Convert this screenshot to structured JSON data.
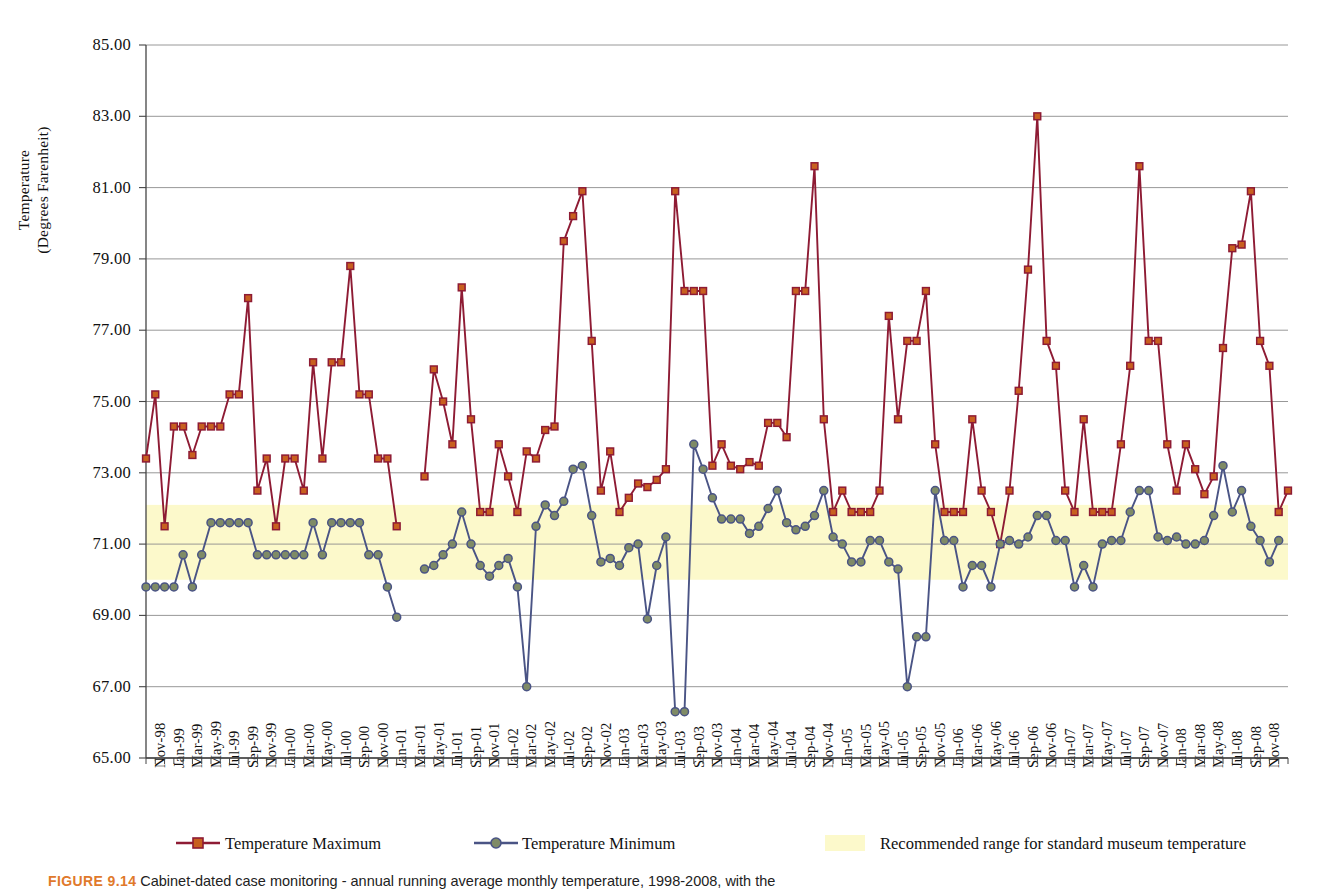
{
  "chart_data": {
    "type": "line",
    "title": "",
    "xlabel": "",
    "ylabel": "Temperature\n(Degrees Farenheit)",
    "ylim": [
      65.0,
      85.0
    ],
    "ytick_values": [
      65.0,
      67.0,
      69.0,
      71.0,
      73.0,
      75.0,
      77.0,
      79.0,
      81.0,
      83.0,
      85.0
    ],
    "ytick_labels": [
      "65.00",
      "67.00",
      "69.00",
      "71.00",
      "73.00",
      "75.00",
      "77.00",
      "79.00",
      "81.00",
      "83.00",
      "85.00"
    ],
    "grid": true,
    "legend_position": "bottom",
    "x_start": "Nov-98",
    "x_end": "Nov-08",
    "xtick_labels": [
      "Nov-98",
      "Jan-99",
      "Mar-99",
      "May-99",
      "Jul-99",
      "Sep-99",
      "Nov-99",
      "Jan-00",
      "Mar-00",
      "May-00",
      "Jul-00",
      "Sep-00",
      "Nov-00",
      "Jan-01",
      "Mar-01",
      "May-01",
      "Jul-01",
      "Sep-01",
      "Nov-01",
      "Jan-02",
      "Mar-02",
      "May-02",
      "Jul-02",
      "Sep-02",
      "Nov-02",
      "Jan-03",
      "Mar-03",
      "May-03",
      "Jul-03",
      "Sep-03",
      "Nov-03",
      "Jan-04",
      "Mar-04",
      "May-04",
      "Jul-04",
      "Sep-04",
      "Nov-04",
      "Jan-05",
      "Mar-05",
      "May-05",
      "Jul-05",
      "Sep-05",
      "Nov-05",
      "Jan-06",
      "Mar-06",
      "May-06",
      "Jul-06",
      "Sep-06",
      "Nov-06",
      "Jan-07",
      "Mar-07",
      "May-07",
      "Jul-07",
      "Sep-07",
      "Nov-07",
      "Jan-08",
      "Mar-08",
      "May-08",
      "Jul-08",
      "Sep-08",
      "Nov-08"
    ],
    "series": [
      {
        "name": "Temperature Maximum",
        "color": "#8E1B34",
        "marker": "square",
        "marker_fill": "#C8601F",
        "values": [
          73.4,
          75.2,
          71.5,
          74.3,
          74.3,
          73.5,
          74.3,
          74.3,
          74.3,
          75.2,
          75.2,
          77.9,
          72.5,
          73.4,
          71.5,
          73.4,
          73.4,
          72.5,
          76.1,
          73.4,
          76.1,
          76.1,
          78.8,
          75.2,
          75.2,
          73.4,
          73.4,
          71.5,
          null,
          null,
          72.9,
          75.9,
          75.0,
          73.8,
          78.2,
          74.5,
          71.9,
          71.9,
          73.8,
          72.9,
          71.9,
          73.6,
          73.4,
          74.2,
          74.3,
          79.5,
          80.2,
          80.9,
          76.7,
          72.5,
          73.6,
          71.9,
          72.3,
          72.7,
          72.6,
          72.8,
          73.1,
          80.9,
          78.1,
          78.1,
          78.1,
          73.2,
          73.8,
          73.2,
          73.1,
          73.3,
          73.2,
          74.4,
          74.4,
          74.0,
          78.1,
          78.1,
          81.6,
          74.5,
          71.9,
          72.5,
          71.9,
          71.9,
          71.9,
          72.5,
          77.4,
          74.5,
          76.7,
          76.7,
          78.1,
          73.8,
          71.9,
          71.9,
          71.9,
          74.5,
          72.5,
          71.9,
          71.0,
          72.5,
          75.3,
          78.7,
          83.0,
          76.7,
          76.0,
          72.5,
          71.9,
          74.5,
          71.9,
          71.9,
          71.9,
          73.8,
          76.0,
          81.6,
          76.7,
          76.7,
          73.8,
          72.5,
          73.8,
          73.1,
          72.4,
          72.9,
          76.5,
          79.3,
          79.4,
          80.9,
          76.7,
          76.0,
          71.9,
          72.5
        ]
      },
      {
        "name": "Temperature Minimum",
        "color": "#4A5485",
        "marker": "circle",
        "marker_fill": "#7F8B66",
        "values": [
          69.8,
          69.8,
          69.8,
          69.8,
          70.7,
          69.8,
          70.7,
          71.6,
          71.6,
          71.6,
          71.6,
          71.6,
          70.7,
          70.7,
          70.7,
          70.7,
          70.7,
          70.7,
          71.6,
          70.7,
          71.6,
          71.6,
          71.6,
          71.6,
          70.7,
          70.7,
          69.8,
          68.95,
          null,
          null,
          70.3,
          70.4,
          70.7,
          71.0,
          71.9,
          71.0,
          70.4,
          70.1,
          70.4,
          70.6,
          69.8,
          67.0,
          71.5,
          72.1,
          71.8,
          72.2,
          73.1,
          73.2,
          71.8,
          70.5,
          70.6,
          70.4,
          70.9,
          71.0,
          68.9,
          70.4,
          71.2,
          66.3,
          66.3,
          73.8,
          73.1,
          72.3,
          71.7,
          71.7,
          71.7,
          71.3,
          71.5,
          72.0,
          72.5,
          71.6,
          71.4,
          71.5,
          71.8,
          72.5,
          71.2,
          71.0,
          70.5,
          70.5,
          71.1,
          71.1,
          70.5,
          70.3,
          67.0,
          68.4,
          68.4,
          72.5,
          71.1,
          71.1,
          69.8,
          70.4,
          70.4,
          69.8,
          71.0,
          71.1,
          71.0,
          71.2,
          71.8,
          71.8,
          71.1,
          71.1,
          69.8,
          70.4,
          69.8,
          71.0,
          71.1,
          71.1,
          71.9,
          72.5,
          72.5,
          71.2,
          71.1,
          71.2,
          71.0,
          71.0,
          71.1,
          71.8,
          73.2,
          71.9,
          72.5,
          71.5,
          71.1,
          70.5,
          71.1
        ]
      }
    ],
    "bands": [
      {
        "name": "Recommended range for standard museum temperature",
        "color": "#FCF9CB",
        "y_min": 70.0,
        "y_max": 72.1
      }
    ]
  },
  "legend": {
    "items": [
      {
        "label": "Temperature Maximum",
        "marker": "square-line",
        "color": "#8E1B34"
      },
      {
        "label": "Temperature Minimum",
        "marker": "circle-line",
        "color": "#4A5485"
      },
      {
        "label": "Recommended range for standard museum temperature",
        "marker": "swatch",
        "color": "#FCF9CB"
      }
    ]
  },
  "caption": {
    "tag": "FIGURE 9.14",
    "text": "Cabinet-dated case monitoring - annual running average monthly temperature, 1998-2008, with the"
  }
}
